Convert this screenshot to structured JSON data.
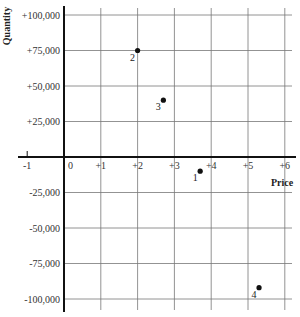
{
  "chart_data": {
    "type": "scatter",
    "title": "",
    "xlabel": "Price",
    "ylabel": "Quantity",
    "xlim": [
      -1,
      6.2
    ],
    "ylim": [
      -105000,
      105000
    ],
    "grid": true,
    "legend": null,
    "x_ticks": [
      "-1",
      "0",
      "+1",
      "+2",
      "+3",
      "+4",
      "+5",
      "+6"
    ],
    "x_tick_values": [
      -1,
      0,
      1,
      2,
      3,
      4,
      5,
      6
    ],
    "y_ticks": [
      "+100,000",
      "+75,000",
      "+50,000",
      "+25,000",
      "-25,000",
      "-50,000",
      "-75,000",
      "-100,000"
    ],
    "y_tick_values": [
      100000,
      75000,
      50000,
      25000,
      -25000,
      -50000,
      -75000,
      -100000
    ],
    "points": [
      {
        "label": "1",
        "x": 3.7,
        "y": -10000
      },
      {
        "label": "2",
        "x": 2.0,
        "y": 75000
      },
      {
        "label": "3",
        "x": 2.7,
        "y": 40000
      },
      {
        "label": "4",
        "x": 5.3,
        "y": -92000
      }
    ]
  }
}
